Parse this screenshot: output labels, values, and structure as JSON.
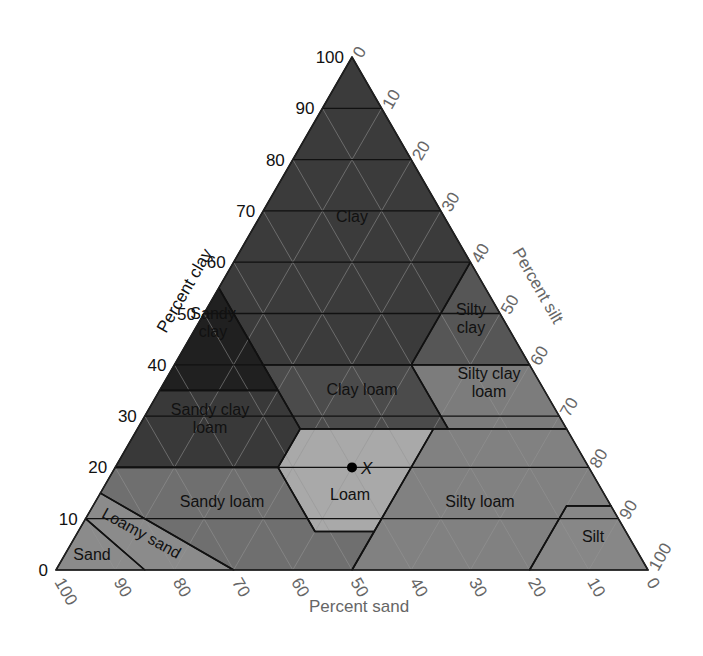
{
  "chart_data": {
    "type": "ternary",
    "title": "",
    "axes": {
      "clay": {
        "label": "Percent clay",
        "ticks": [
          "0",
          "10",
          "20",
          "30",
          "40",
          "50",
          "60",
          "70",
          "80",
          "90",
          "100"
        ],
        "tick_color": "#111111"
      },
      "silt": {
        "label": "Percent silt",
        "ticks": [
          "0",
          "10",
          "20",
          "30",
          "40",
          "50",
          "60",
          "70",
          "80",
          "90",
          "100"
        ],
        "tick_color": "#666666"
      },
      "sand": {
        "label": "Percent sand",
        "ticks": [
          "100",
          "90",
          "80",
          "70",
          "60",
          "50",
          "40",
          "30",
          "20",
          "10",
          "0"
        ],
        "tick_color": "#666666"
      }
    },
    "regions": [
      {
        "name": "Clay",
        "label_lines": [
          "Clay"
        ],
        "fill": "#3b3b3b",
        "vertices_sand_clay": [
          [
            0,
            100
          ],
          [
            45,
            55
          ],
          [
            45,
            40
          ],
          [
            20,
            40
          ],
          [
            0,
            60
          ]
        ],
        "label_at": [
          352,
          222
        ]
      },
      {
        "name": "Sandy clay",
        "label_lines": [
          "Sandy",
          "clay"
        ],
        "fill": "#202020",
        "vertices_sand_clay": [
          [
            45,
            55
          ],
          [
            65,
            35
          ],
          [
            45,
            35
          ],
          [
            45,
            40
          ]
        ],
        "label_at": [
          213,
          328
        ]
      },
      {
        "name": "Silty clay",
        "label_lines": [
          "Silty",
          "clay"
        ],
        "fill": "#565656",
        "vertices_sand_clay": [
          [
            20,
            40
          ],
          [
            0,
            60
          ],
          [
            0,
            40
          ]
        ],
        "label_at": [
          471,
          324
        ]
      },
      {
        "name": "Sandy clay loam",
        "label_lines": [
          "Sandy clay",
          "loam"
        ],
        "fill": "#393939",
        "vertices_sand_clay": [
          [
            65,
            35
          ],
          [
            45,
            35
          ],
          [
            45,
            27.5
          ],
          [
            52.5,
            20
          ],
          [
            80,
            20
          ]
        ],
        "label_at": [
          210,
          424
        ]
      },
      {
        "name": "Clay loam",
        "label_lines": [
          "Clay loam"
        ],
        "fill": "#4b4b4b",
        "vertices_sand_clay": [
          [
            45,
            40
          ],
          [
            20,
            40
          ],
          [
            20,
            27.5
          ],
          [
            45,
            27.5
          ]
        ],
        "label_at": [
          362,
          395
        ]
      },
      {
        "name": "Silty clay loam",
        "label_lines": [
          "Silty clay",
          "loam"
        ],
        "fill": "#7c7c7c",
        "vertices_sand_clay": [
          [
            20,
            40
          ],
          [
            0,
            40
          ],
          [
            0,
            27.5
          ],
          [
            20,
            27.5
          ]
        ],
        "label_at": [
          489,
          388
        ]
      },
      {
        "name": "Loam",
        "label_lines": [
          "Loam"
        ],
        "fill": "#a9a9a9",
        "vertices_sand_clay": [
          [
            45,
            27.5
          ],
          [
            22.5,
            27.5
          ],
          [
            42.5,
            7.5
          ],
          [
            52.5,
            7.5
          ],
          [
            52.5,
            20
          ]
        ],
        "label_at": [
          350,
          500
        ]
      },
      {
        "name": "Sandy loam",
        "label_lines": [
          "Sandy loam"
        ],
        "fill": "#6f6f6f",
        "vertices_sand_clay": [
          [
            80,
            20
          ],
          [
            52.5,
            20
          ],
          [
            52.5,
            7.5
          ],
          [
            42.5,
            7.5
          ],
          [
            50,
            0
          ],
          [
            70,
            0
          ],
          [
            85,
            15
          ]
        ],
        "label_at": [
          222,
          507
        ]
      },
      {
        "name": "Loamy sand",
        "label_lines": [
          "Loamy sand"
        ],
        "fill": "#8b8b8b",
        "vertices_sand_clay": [
          [
            85,
            15
          ],
          [
            70,
            0
          ],
          [
            85,
            0
          ],
          [
            90,
            10
          ]
        ],
        "label_at": [
          139,
          538
        ],
        "label_rotate": 29
      },
      {
        "name": "Sand",
        "label_lines": [
          "Sand"
        ],
        "fill": "#8b8b8b",
        "vertices_sand_clay": [
          [
            90,
            10
          ],
          [
            85,
            0
          ],
          [
            100,
            0
          ]
        ],
        "label_at": [
          92,
          560
        ]
      },
      {
        "name": "Silty loam",
        "label_lines": [
          "Silty loam"
        ],
        "fill": "#818181",
        "vertices_sand_clay": [
          [
            50,
            0
          ],
          [
            42.5,
            7.5
          ],
          [
            22.5,
            27.5
          ],
          [
            0,
            27.5
          ],
          [
            0,
            12.5
          ],
          [
            7.5,
            12.5
          ],
          [
            20,
            0
          ]
        ],
        "label_at": [
          480,
          507
        ]
      },
      {
        "name": "Silt",
        "label_lines": [
          "Silt"
        ],
        "fill": "#878787",
        "vertices_sand_clay": [
          [
            20,
            0
          ],
          [
            7.5,
            12.5
          ],
          [
            0,
            12.5
          ],
          [
            0,
            0
          ]
        ],
        "label_at": [
          593,
          542
        ]
      }
    ],
    "points": [
      {
        "label": "X",
        "sand": 40,
        "silt": 40,
        "clay": 20
      }
    ],
    "grid": true,
    "gridlines_every": 10
  },
  "layout": {
    "left": [
      56,
      570
    ],
    "right": [
      648,
      570
    ],
    "apex": [
      352,
      57
    ]
  }
}
